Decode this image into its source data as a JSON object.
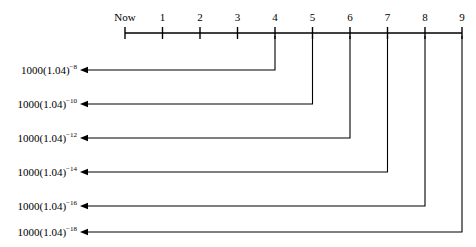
{
  "diagram": {
    "type": "timeline-discounting",
    "background_color": "#ffffff",
    "line_color": "#000000",
    "axis": {
      "name": "time-axis",
      "x_start": 125,
      "x_end": 462,
      "y": 33,
      "tick_spacing": 37.5,
      "ticks": [
        {
          "label": "Now",
          "x": 125
        },
        {
          "label": "1",
          "x": 162.5
        },
        {
          "label": "2",
          "x": 200
        },
        {
          "label": "3",
          "x": 237.5
        },
        {
          "label": "4",
          "x": 275
        },
        {
          "label": "5",
          "x": 312.5
        },
        {
          "label": "6",
          "x": 350
        },
        {
          "label": "7",
          "x": 387.5
        },
        {
          "label": "8",
          "x": 425
        },
        {
          "label": "9",
          "x": 462
        }
      ]
    },
    "rows": [
      {
        "base": "1000(1.04)",
        "exponent": "−8",
        "from_tick": "4",
        "from_x": 275,
        "y": 70,
        "arrow_x": 80
      },
      {
        "base": "1000(1.04)",
        "exponent": "−10",
        "from_tick": "5",
        "from_x": 312.5,
        "y": 104,
        "arrow_x": 80
      },
      {
        "base": "1000(1.04)",
        "exponent": "−12",
        "from_tick": "6",
        "from_x": 350,
        "y": 138,
        "arrow_x": 80
      },
      {
        "base": "1000(1.04)",
        "exponent": "−14",
        "from_tick": "7",
        "from_x": 387.5,
        "y": 172,
        "arrow_x": 80
      },
      {
        "base": "1000(1.04)",
        "exponent": "−16",
        "from_tick": "8",
        "from_x": 425,
        "y": 206,
        "arrow_x": 80
      },
      {
        "base": "1000(1.04)",
        "exponent": "−18",
        "from_tick": "9",
        "from_x": 462,
        "y": 232,
        "arrow_x": 80
      }
    ]
  }
}
